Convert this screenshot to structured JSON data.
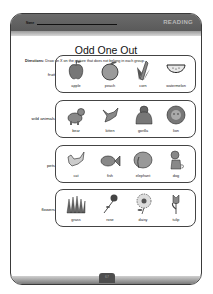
{
  "header": {
    "name_label": "Name",
    "subject": "READING"
  },
  "title": "Odd One Out",
  "directions": {
    "label": "Directions:",
    "text": " Draw an X on the picture that does not belong in each group."
  },
  "groups": [
    {
      "category": "fruit",
      "items": [
        {
          "label": "apple",
          "icon": "apple-icon"
        },
        {
          "label": "peach",
          "icon": "peach-icon"
        },
        {
          "label": "corn",
          "icon": "corn-icon"
        },
        {
          "label": "watermelon",
          "icon": "watermelon-icon"
        }
      ]
    },
    {
      "category": "wild animals",
      "items": [
        {
          "label": "bear",
          "icon": "bear-icon"
        },
        {
          "label": "kitten",
          "icon": "kitten-icon"
        },
        {
          "label": "gorilla",
          "icon": "gorilla-icon"
        },
        {
          "label": "lion",
          "icon": "lion-icon"
        }
      ]
    },
    {
      "category": "pets",
      "items": [
        {
          "label": "cat",
          "icon": "cat-icon"
        },
        {
          "label": "fish",
          "icon": "fish-icon"
        },
        {
          "label": "elephant",
          "icon": "elephant-icon"
        },
        {
          "label": "dog",
          "icon": "dog-icon"
        }
      ]
    },
    {
      "category": "flowers",
      "items": [
        {
          "label": "grass",
          "icon": "grass-icon"
        },
        {
          "label": "rose",
          "icon": "rose-icon"
        },
        {
          "label": "daisy",
          "icon": "daisy-icon"
        },
        {
          "label": "tulip",
          "icon": "tulip-icon"
        }
      ]
    }
  ],
  "footer": {
    "page_number": "67"
  },
  "colors": {
    "header": "#5f5f5f",
    "border": "#3a3a3a",
    "subject_text": "#b8b8b8"
  }
}
